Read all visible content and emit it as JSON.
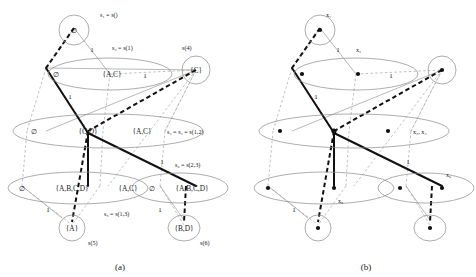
{
  "figure": {
    "panels": [
      {
        "id": "a",
        "caption": "(a)",
        "nodes_top": {
          "circle_label": "∅",
          "state_label": "s₁ = s()"
        },
        "row2": {
          "ellipse_items": [
            "∅",
            "{A,C}"
          ],
          "state_label": "s₂ = s(1)",
          "right_circle_label": "{C}",
          "right_circle_state": "s(4)"
        },
        "row3": {
          "ellipse_items": [
            "∅",
            "{C,D}",
            "{A,C}"
          ],
          "state_label": "s₃ = s₄ = s(1,2)"
        },
        "row4_left": {
          "ellipse_items": [
            "∅",
            "{A,B,C,D}",
            "{A,C}"
          ],
          "state_label": "s₅ = s(1,3)"
        },
        "row4_right": {
          "ellipse_items": [
            "∅",
            "{A,B,C,D}"
          ],
          "state_label": "s₆ = s(2,3)"
        },
        "leaf_left": {
          "circle_label": "{A}",
          "state_label": "s(5)"
        },
        "leaf_right": {
          "circle_label": "{B,D}",
          "state_label": "s(6)"
        },
        "edge_weights": [
          "1",
          "1",
          "1",
          "1",
          "1",
          "1",
          "1"
        ]
      },
      {
        "id": "b",
        "caption": "(b)",
        "node_labels": {
          "x1": "x₁",
          "x2": "x₂",
          "x34": "x₃, x₄",
          "x5": "x₅",
          "x6": "x₆"
        },
        "edge_weights": [
          "1",
          "1",
          "1",
          "1",
          "1"
        ]
      }
    ]
  }
}
